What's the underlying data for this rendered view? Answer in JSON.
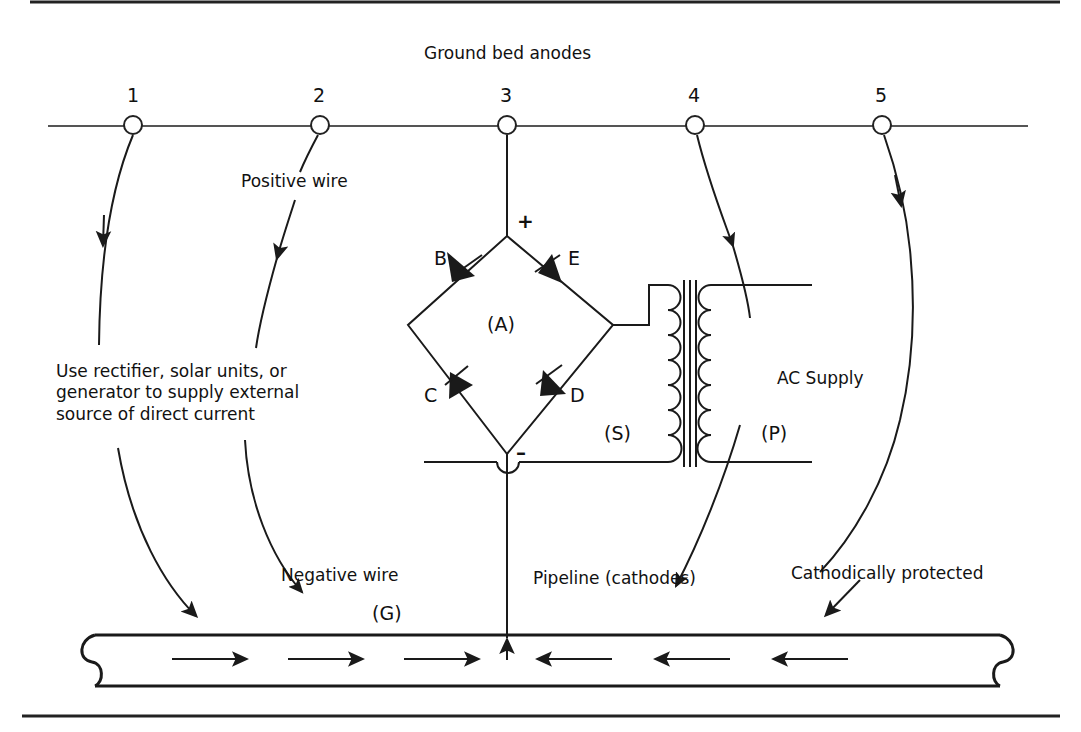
{
  "diagram": {
    "title": "Ground bed anodes",
    "anode_numbers": [
      "1",
      "2",
      "3",
      "4",
      "5"
    ],
    "labels": {
      "positive_wire": "Positive wire",
      "negative_wire": "Negative wire",
      "source_note": "Use rectifier, solar units, or\ngenerator to supply external\nsource of direct current",
      "ac_supply": "AC Supply",
      "pipeline": "Pipeline (cathodes)",
      "cathodically_protected": "Cathodically protected"
    },
    "rectifier": {
      "center_label": "(A)",
      "diode_b": "B",
      "diode_e": "E",
      "diode_c": "C",
      "diode_d": "D",
      "plus_sign": "+",
      "minus_sign": "–"
    },
    "transformer": {
      "secondary_label": "(S)",
      "primary_label": "(P)"
    },
    "ground_label": "(G)",
    "colors": {
      "ink": "#1a1a1a",
      "line": "#333333",
      "background": "#ffffff"
    }
  }
}
